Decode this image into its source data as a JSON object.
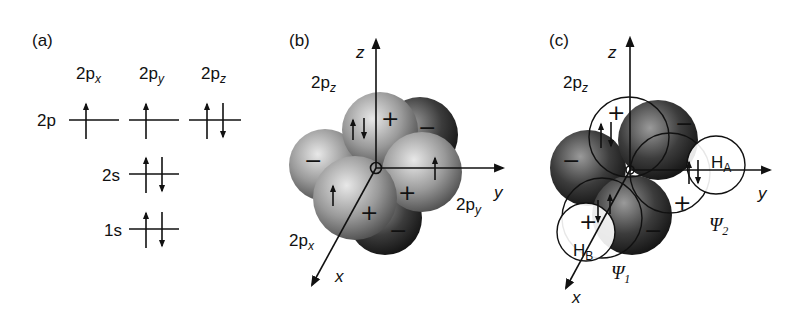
{
  "panels": {
    "a": {
      "label": "(a)",
      "columns": [
        {
          "base": "2p",
          "sub": "x"
        },
        {
          "base": "2p",
          "sub": "y"
        },
        {
          "base": "2p",
          "sub": "z"
        }
      ],
      "levels": [
        {
          "name": "2p",
          "orbitals": [
            "up",
            "up",
            "up-down"
          ]
        },
        {
          "name": "2s",
          "orbitals": [
            "up-down"
          ]
        },
        {
          "name": "1s",
          "orbitals": [
            "up-down"
          ]
        }
      ]
    },
    "b": {
      "label": "(b)",
      "axes": {
        "z": "z",
        "y": "y",
        "x": "x"
      },
      "orbital_labels": {
        "pz": {
          "base": "2p",
          "sub": "z"
        },
        "py": {
          "base": "2p",
          "sub": "y"
        },
        "px": {
          "base": "2p",
          "sub": "x"
        }
      },
      "signs": {
        "plus": "+",
        "minus": "−"
      }
    },
    "c": {
      "label": "(c)",
      "axes": {
        "z": "z",
        "y": "y",
        "x": "x"
      },
      "orbital_labels": {
        "pz": {
          "base": "2p",
          "sub": "z"
        }
      },
      "hydrogens": {
        "HA": {
          "base": "H",
          "sub": "A"
        },
        "HB": {
          "base": "H",
          "sub": "B"
        }
      },
      "bonds": {
        "psi1": {
          "base": "Ψ",
          "sub": "1"
        },
        "psi2": {
          "base": "Ψ",
          "sub": "2"
        }
      },
      "signs": {
        "plus": "+",
        "minus": "−"
      }
    }
  }
}
